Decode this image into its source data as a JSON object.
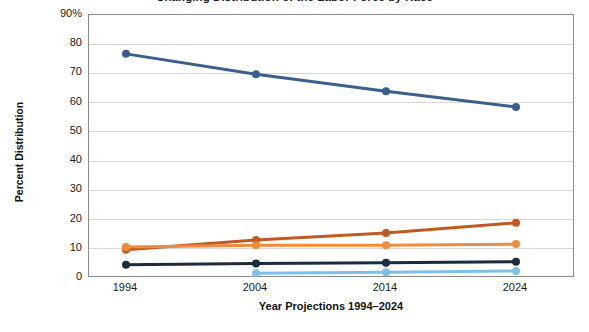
{
  "chart_data": {
    "type": "line",
    "title": "Changing Distribution of the Labor Force by Race",
    "xlabel": "Year Projections 1994–2024",
    "ylabel": "Percent Distribution",
    "x": [
      1994,
      2004,
      2014,
      2024
    ],
    "categories": [
      "1994",
      "2004",
      "2014",
      "2024"
    ],
    "ylim": [
      0,
      90
    ],
    "ytick_labels": [
      "90%",
      "80",
      "70",
      "60",
      "50",
      "40",
      "30",
      "20",
      "10",
      "0"
    ],
    "ytick_values": [
      90,
      80,
      70,
      60,
      50,
      40,
      30,
      20,
      10,
      0
    ],
    "grid": true,
    "legend": "none",
    "series": [
      {
        "name": "series-1",
        "color": "#3a5f8f",
        "values": [
          76.7,
          69.7,
          63.9,
          58.5
        ]
      },
      {
        "name": "series-2",
        "color": "#c05a22",
        "values": [
          9.7,
          13.0,
          15.4,
          18.9
        ]
      },
      {
        "name": "series-3",
        "color": "#ef8b3c",
        "values": [
          10.6,
          11.2,
          11.2,
          11.6
        ]
      },
      {
        "name": "series-4",
        "color": "#1c2c3e",
        "values": [
          4.5,
          5.0,
          5.2,
          5.6
        ]
      },
      {
        "name": "series-5",
        "color": "#7ec0e8",
        "values": [
          null,
          1.6,
          2.0,
          2.4
        ]
      }
    ]
  }
}
